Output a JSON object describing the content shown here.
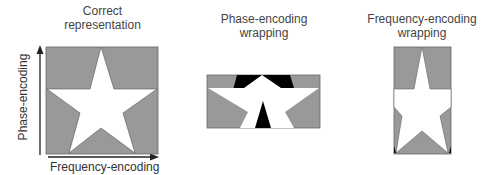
{
  "panels": [
    {
      "title_line1": "Correct",
      "title_line2": "representation"
    },
    {
      "title_line1": "Phase-encoding",
      "title_line2": "wrapping"
    },
    {
      "title_line1": "Frequency-encoding",
      "title_line2": "wrapping"
    }
  ],
  "axes": {
    "y_label": "Phase-encoding",
    "x_label": "Frequency-encoding"
  },
  "colors": {
    "background_fill": "#999999",
    "star_fill": "#ffffff",
    "wrap_fill": "#000000",
    "outline": "#666666"
  }
}
